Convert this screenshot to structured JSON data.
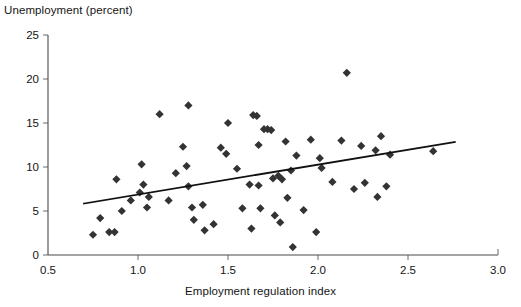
{
  "chart_data": {
    "type": "scatter",
    "title": "",
    "ylabel": "Unemployment (percent)",
    "xlabel": "Employment regulation index",
    "xlim": [
      0.5,
      3.0
    ],
    "ylim": [
      0,
      25
    ],
    "xticks": [
      0.5,
      1.0,
      1.5,
      2.0,
      2.5,
      3.0
    ],
    "xticklabels": [
      "0.5",
      "1.0",
      "1.5",
      "2.0",
      "2.5",
      "3.0"
    ],
    "yticks": [
      0,
      5,
      10,
      15,
      20,
      25
    ],
    "yticklabels": [
      "0",
      "5",
      "10",
      "15",
      "20",
      "25"
    ],
    "grid": false,
    "legend": null,
    "marker": "diamond",
    "marker_color": "#333333",
    "points": [
      {
        "x": 0.75,
        "y": 2.3
      },
      {
        "x": 0.79,
        "y": 4.2
      },
      {
        "x": 0.84,
        "y": 2.6
      },
      {
        "x": 0.87,
        "y": 2.6
      },
      {
        "x": 0.88,
        "y": 8.6
      },
      {
        "x": 0.91,
        "y": 5.0
      },
      {
        "x": 0.96,
        "y": 6.2
      },
      {
        "x": 1.01,
        "y": 7.1
      },
      {
        "x": 1.02,
        "y": 10.3
      },
      {
        "x": 1.03,
        "y": 8.0
      },
      {
        "x": 1.05,
        "y": 5.4
      },
      {
        "x": 1.06,
        "y": 6.6
      },
      {
        "x": 1.12,
        "y": 16.0
      },
      {
        "x": 1.17,
        "y": 6.2
      },
      {
        "x": 1.21,
        "y": 9.3
      },
      {
        "x": 1.25,
        "y": 12.3
      },
      {
        "x": 1.27,
        "y": 10.1
      },
      {
        "x": 1.28,
        "y": 17.0
      },
      {
        "x": 1.28,
        "y": 7.8
      },
      {
        "x": 1.3,
        "y": 5.4
      },
      {
        "x": 1.31,
        "y": 4.0
      },
      {
        "x": 1.36,
        "y": 5.7
      },
      {
        "x": 1.37,
        "y": 2.8
      },
      {
        "x": 1.42,
        "y": 3.5
      },
      {
        "x": 1.46,
        "y": 12.2
      },
      {
        "x": 1.49,
        "y": 11.5
      },
      {
        "x": 1.5,
        "y": 15.0
      },
      {
        "x": 1.55,
        "y": 9.8
      },
      {
        "x": 1.58,
        "y": 5.3
      },
      {
        "x": 1.62,
        "y": 8.0
      },
      {
        "x": 1.63,
        "y": 3.0
      },
      {
        "x": 1.64,
        "y": 15.9
      },
      {
        "x": 1.66,
        "y": 15.8
      },
      {
        "x": 1.67,
        "y": 7.9
      },
      {
        "x": 1.67,
        "y": 12.5
      },
      {
        "x": 1.68,
        "y": 5.3
      },
      {
        "x": 1.7,
        "y": 14.3
      },
      {
        "x": 1.72,
        "y": 14.3
      },
      {
        "x": 1.74,
        "y": 14.2
      },
      {
        "x": 1.75,
        "y": 8.7
      },
      {
        "x": 1.76,
        "y": 4.5
      },
      {
        "x": 1.78,
        "y": 9.0
      },
      {
        "x": 1.79,
        "y": 3.7
      },
      {
        "x": 1.8,
        "y": 8.6
      },
      {
        "x": 1.82,
        "y": 12.9
      },
      {
        "x": 1.83,
        "y": 6.5
      },
      {
        "x": 1.85,
        "y": 9.6
      },
      {
        "x": 1.86,
        "y": 0.9
      },
      {
        "x": 1.88,
        "y": 11.3
      },
      {
        "x": 1.92,
        "y": 5.1
      },
      {
        "x": 1.96,
        "y": 13.1
      },
      {
        "x": 1.99,
        "y": 2.6
      },
      {
        "x": 2.01,
        "y": 11.0
      },
      {
        "x": 2.02,
        "y": 9.9
      },
      {
        "x": 2.08,
        "y": 8.3
      },
      {
        "x": 2.13,
        "y": 13.0
      },
      {
        "x": 2.16,
        "y": 20.7
      },
      {
        "x": 2.2,
        "y": 7.5
      },
      {
        "x": 2.24,
        "y": 12.4
      },
      {
        "x": 2.26,
        "y": 8.2
      },
      {
        "x": 2.32,
        "y": 11.9
      },
      {
        "x": 2.33,
        "y": 6.6
      },
      {
        "x": 2.35,
        "y": 13.5
      },
      {
        "x": 2.38,
        "y": 7.8
      },
      {
        "x": 2.4,
        "y": 11.4
      },
      {
        "x": 2.64,
        "y": 11.8
      }
    ],
    "trendline": {
      "x_start": 0.7,
      "y_start": 5.85,
      "x_end": 2.76,
      "y_end": 12.85
    }
  }
}
